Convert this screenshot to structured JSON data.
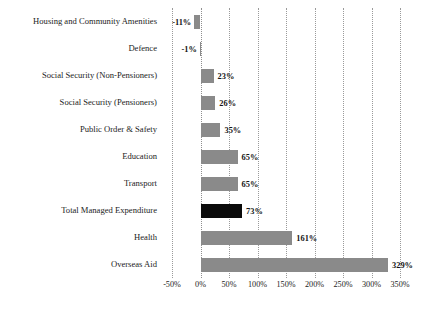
{
  "chart_data": {
    "type": "bar",
    "orientation": "horizontal",
    "title": "",
    "subtitle": "",
    "xlabel": "",
    "ylabel": "",
    "xlim": [
      -50,
      350
    ],
    "grid": true,
    "legend": false,
    "xticks": [
      "-50%",
      "0%",
      "50%",
      "100%",
      "150%",
      "200%",
      "250%",
      "300%",
      "350%"
    ],
    "xtick_values": [
      -50,
      0,
      50,
      100,
      150,
      200,
      250,
      300,
      350
    ],
    "categories": [
      "Housing and Community Amenities",
      "Defence",
      "Social Security (Non-Pensioners)",
      "Social Security (Pensioners)",
      "Public Order & Safety",
      "Education",
      "Transport",
      "Total Managed Expenditure",
      "Health",
      "Overseas Aid"
    ],
    "values": [
      -11,
      -1,
      23,
      26,
      35,
      65,
      65,
      73,
      161,
      329
    ],
    "labels": [
      "-11%",
      "-1%",
      "23%",
      "26%",
      "35%",
      "65%",
      "65%",
      "73%",
      "161%",
      "329%"
    ],
    "highlight_index": 7,
    "colors": {
      "bar": "#8a8a8a",
      "highlight_bar": "#0b0b0b",
      "gridline": "#9a9a9a",
      "text": "#1c1c1c",
      "background": "#ffffff"
    }
  }
}
